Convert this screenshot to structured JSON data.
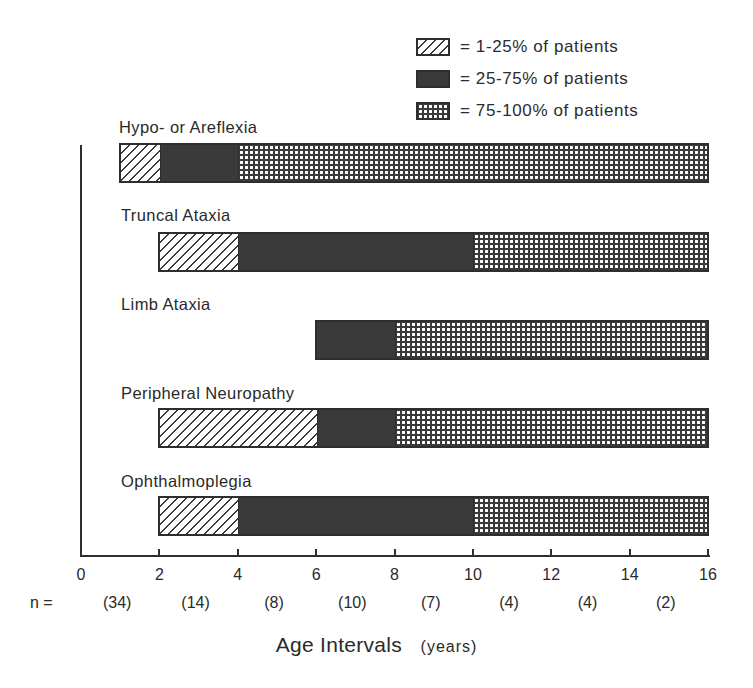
{
  "chart_data": {
    "type": "bar",
    "orientation": "horizontal",
    "stacked": true,
    "title": "",
    "xlabel": "Age Intervals",
    "xlabel_units": "(years)",
    "ylabel": "",
    "xlim": [
      0,
      16
    ],
    "x_ticks": [
      0,
      2,
      4,
      6,
      8,
      10,
      12,
      14,
      16
    ],
    "n_prefix": "n =",
    "n_per_interval": [
      "(34)",
      "(14)",
      "(8)",
      "(10)",
      "(7)",
      "(4)",
      "(4)",
      "(2)"
    ],
    "legend": [
      {
        "key": "hatch",
        "label": "= 1-25% of patients"
      },
      {
        "key": "solid",
        "label": "= 25-75% of patients"
      },
      {
        "key": "cross",
        "label": "= 75-100% of patients"
      }
    ],
    "legend_position": "top-right",
    "grid": false,
    "categories": [
      "Hypo- or Areflexia",
      "Truncal Ataxia",
      "Limb Ataxia",
      "Peripheral Neuropathy",
      "Ophthalmoplegia"
    ],
    "series": [
      {
        "category": "Hypo- or Areflexia",
        "segments": [
          {
            "pattern": "hatch",
            "start": 1,
            "end": 2
          },
          {
            "pattern": "solid",
            "start": 2,
            "end": 4
          },
          {
            "pattern": "cross",
            "start": 4,
            "end": 16
          }
        ]
      },
      {
        "category": "Truncal Ataxia",
        "segments": [
          {
            "pattern": "hatch",
            "start": 2,
            "end": 4
          },
          {
            "pattern": "solid",
            "start": 4,
            "end": 10
          },
          {
            "pattern": "cross",
            "start": 10,
            "end": 16
          }
        ]
      },
      {
        "category": "Limb Ataxia",
        "segments": [
          {
            "pattern": "solid",
            "start": 6,
            "end": 8
          },
          {
            "pattern": "cross",
            "start": 8,
            "end": 16
          }
        ]
      },
      {
        "category": "Peripheral Neuropathy",
        "segments": [
          {
            "pattern": "hatch",
            "start": 2,
            "end": 6
          },
          {
            "pattern": "solid",
            "start": 6,
            "end": 8
          },
          {
            "pattern": "cross",
            "start": 8,
            "end": 16
          }
        ]
      },
      {
        "category": "Ophthalmoplegia",
        "segments": [
          {
            "pattern": "hatch",
            "start": 2,
            "end": 4
          },
          {
            "pattern": "solid",
            "start": 4,
            "end": 10
          },
          {
            "pattern": "cross",
            "start": 10,
            "end": 16
          }
        ]
      }
    ]
  },
  "colors": {
    "ink": "#2e2e2e",
    "fill_dark": "#3a3a3a",
    "background": "#ffffff"
  }
}
